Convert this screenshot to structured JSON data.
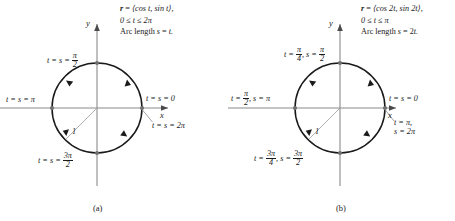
{
  "figure": {
    "panels": [
      {
        "id": "a",
        "caption": "(a)",
        "equation_lines": [
          "r = ⟨cos t, sin t⟩,",
          "0 ≤ t ≤ 2π",
          "Arc length s = t."
        ],
        "vector_symbol": "r",
        "components": "⟨cos t, sin t⟩,",
        "domain": "0 ≤ t ≤ 2π",
        "arclength": "Arc length s = t.",
        "axis_x_label": "x",
        "axis_y_label": "y",
        "radius_label": "1",
        "points": [
          {
            "name": "right-start",
            "label_prefix": "t = s = ",
            "label_value": "0",
            "angle_deg": 0
          },
          {
            "name": "right-end",
            "label_prefix": "t = s = ",
            "label_value": "2π",
            "angle_deg": 0
          },
          {
            "name": "top",
            "label_prefix": "t = s = ",
            "label_num": "π",
            "label_den": "2",
            "angle_deg": 90
          },
          {
            "name": "left",
            "label_prefix": "t = s = ",
            "label_value": "π",
            "angle_deg": 180
          },
          {
            "name": "bottom",
            "label_prefix": "t = s = ",
            "label_num": "3π",
            "label_den": "2",
            "angle_deg": 270
          }
        ]
      },
      {
        "id": "b",
        "caption": "(b)",
        "equation_lines": [
          "r = ⟨cos 2t, sin 2t⟩,",
          "0 ≤ t ≤ π",
          "Arc length s = 2t."
        ],
        "vector_symbol": "r",
        "components": "⟨cos 2t, sin 2t⟩,",
        "domain": "0 ≤ t ≤ π",
        "arclength": "Arc length s = 2t.",
        "axis_x_label": "x",
        "axis_y_label": "y",
        "radius_label": "1",
        "points": [
          {
            "name": "right-start",
            "label_prefix": "t = s = ",
            "label_value": "0",
            "angle_deg": 0
          },
          {
            "name": "right-end",
            "label_line1": "t = π,",
            "label_line2": "s = 2π",
            "angle_deg": 0
          },
          {
            "name": "top",
            "t_num": "π",
            "t_den": "4",
            "s_num": "π",
            "s_den": "2",
            "angle_deg": 90
          },
          {
            "name": "left",
            "t_num": "π",
            "t_den": "2",
            "s_value": "π",
            "angle_deg": 180
          },
          {
            "name": "bottom",
            "t_num": "3π",
            "t_den": "4",
            "s_num": "3π",
            "s_den": "2",
            "angle_deg": 270
          }
        ]
      }
    ],
    "text": {
      "t_eq": "t = ",
      "s_eq": "s = ",
      "comma_s": ", s = ",
      "ts_eq": "t = s = ",
      "arrow_direction": "counterclockwise"
    },
    "colors": {
      "curve": "#1a1a1a",
      "axis": "#808080",
      "radius_line": "#9a9a9a",
      "text": "#1a1a1a",
      "background": "#ffffff"
    },
    "geometry": {
      "panel_a_center": [
        97,
        108
      ],
      "panel_b_center": [
        340,
        108
      ],
      "radius_px": 45
    }
  }
}
